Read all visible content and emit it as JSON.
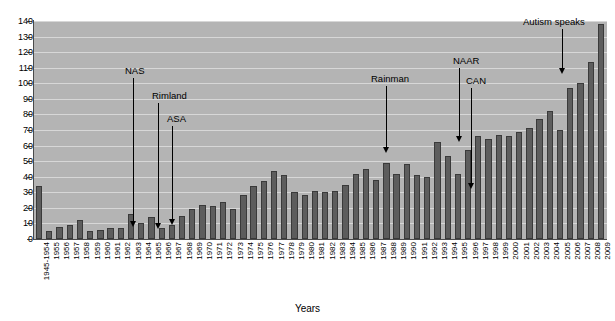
{
  "chart_data": {
    "type": "bar",
    "title": "",
    "xlabel": "Years",
    "ylabel": "",
    "ylim": [
      0,
      140
    ],
    "ytick_step": 10,
    "yticks": [
      0,
      10,
      20,
      30,
      40,
      50,
      60,
      70,
      80,
      90,
      100,
      110,
      120,
      130,
      140
    ],
    "grid": true,
    "legend": null,
    "bar_color": "#5d5d5d",
    "plot_background": "#b4b4b4",
    "categories": [
      "1945-1954",
      "1955",
      "1956",
      "1957",
      "1958",
      "1959",
      "1960",
      "1961",
      "1962",
      "1963",
      "1964",
      "1965",
      "1966",
      "1967",
      "1968",
      "1969",
      "1970",
      "1971",
      "1972",
      "1973",
      "1974",
      "1975",
      "1976",
      "1977",
      "1978",
      "1979",
      "1980",
      "1981",
      "1982",
      "1983",
      "1984",
      "1985",
      "1986",
      "1987",
      "1988",
      "1989",
      "1990",
      "1991",
      "1992",
      "1993",
      "1994",
      "1995",
      "1996",
      "1997",
      "1998",
      "1999",
      "2000",
      "2001",
      "2002",
      "2003",
      "2004",
      "2005",
      "2006",
      "2007",
      "2008",
      "2009"
    ],
    "values": [
      34,
      5,
      8,
      9,
      12,
      5,
      6,
      7,
      7,
      16,
      10,
      14,
      7,
      9,
      15,
      19,
      22,
      21,
      24,
      19,
      28,
      34,
      37,
      44,
      41,
      30,
      28,
      31,
      30,
      31,
      35,
      42,
      45,
      38,
      49,
      42,
      48,
      41,
      40,
      62,
      53,
      42,
      57,
      66,
      64,
      67,
      66,
      69,
      71,
      77,
      82,
      70,
      97,
      100,
      114,
      138
    ],
    "annotations": [
      {
        "label": "NAS",
        "category": "1962",
        "label_x": 125,
        "label_y": 66,
        "line_x": 133,
        "line_top": 78,
        "line_bottom": 227
      },
      {
        "label": "Rimland",
        "category": "1964",
        "label_x": 152,
        "label_y": 91,
        "line_x": 158,
        "line_top": 103,
        "line_bottom": 229
      },
      {
        "label": "ASA",
        "category": "1965",
        "label_x": 167,
        "label_y": 114,
        "line_x": 172,
        "line_top": 126,
        "line_bottom": 225
      },
      {
        "label": "Rainman",
        "category": "1988",
        "label_x": 371,
        "label_y": 74,
        "line_x": 386,
        "line_top": 86,
        "line_bottom": 153
      },
      {
        "label": "NAAR",
        "category": "1993",
        "label_x": 453,
        "label_y": 56,
        "line_x": 459,
        "line_top": 68,
        "line_bottom": 142
      },
      {
        "label": "CAN",
        "category": "1995",
        "label_x": 466,
        "label_y": 76,
        "line_x": 471,
        "line_top": 88,
        "line_bottom": 189
      },
      {
        "label": "Autism speaks",
        "category": "2006",
        "label_x": 523,
        "label_y": 17,
        "line_x": 562,
        "line_top": 29,
        "line_bottom": 74
      }
    ]
  }
}
